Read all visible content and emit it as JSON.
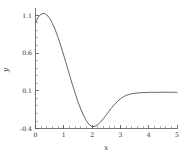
{
  "chart_data": {
    "type": "line",
    "title": "",
    "xlabel": "x",
    "ylabel": "y",
    "xlim": [
      0,
      5
    ],
    "ylim": [
      -0.4,
      1.2
    ],
    "grid": false,
    "legend": null,
    "xticks": [
      "0",
      "1",
      "2",
      "3",
      "4",
      "5"
    ],
    "xtick_values": [
      0,
      1,
      2,
      3,
      4,
      5
    ],
    "yticks": [
      "1.1",
      "0.6",
      "0.1",
      "-0.4"
    ],
    "ytick_values": [
      1.1,
      0.6,
      0.1,
      -0.4
    ],
    "x_minor_tick_step": 0.1,
    "y_minor_tick_step": 0.1,
    "series": [
      {
        "name": "curve",
        "color": "#4a4a4a",
        "x": [
          0.0,
          0.1,
          0.2,
          0.3,
          0.4,
          0.5,
          0.6,
          0.7,
          0.8,
          0.9,
          1.0,
          1.1,
          1.2,
          1.3,
          1.4,
          1.5,
          1.6,
          1.7,
          1.8,
          1.9,
          2.0,
          2.1,
          2.2,
          2.3,
          2.4,
          2.5,
          2.6,
          2.7,
          2.8,
          2.9,
          3.0,
          3.1,
          3.2,
          3.3,
          3.4,
          3.5,
          3.6,
          3.7,
          3.8,
          3.9,
          4.0,
          4.1,
          4.2,
          4.3,
          4.4,
          4.5,
          4.6,
          4.7,
          4.8,
          4.9,
          5.0
        ],
        "y": [
          1.0,
          1.077,
          1.117,
          1.126,
          1.106,
          1.06,
          0.992,
          0.905,
          0.803,
          0.689,
          0.567,
          0.441,
          0.313,
          0.188,
          0.068,
          -0.043,
          -0.143,
          -0.229,
          -0.299,
          -0.35,
          -0.375,
          -0.372,
          -0.35,
          -0.315,
          -0.27,
          -0.22,
          -0.17,
          -0.122,
          -0.078,
          -0.04,
          -0.007,
          0.019,
          0.038,
          0.051,
          0.06,
          0.066,
          0.071,
          0.074,
          0.076,
          0.077,
          0.078,
          0.079,
          0.079,
          0.08,
          0.08,
          0.08,
          0.08,
          0.08,
          0.08,
          0.08,
          0.08
        ]
      }
    ]
  },
  "figure": {
    "background_color": "#ffffff",
    "axis_color": "#555555",
    "text_color": "#2b2b2b"
  }
}
